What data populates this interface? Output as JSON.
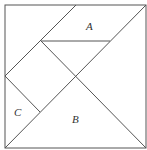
{
  "diagram": {
    "labels": {
      "a": "A",
      "b": "B",
      "c": "C"
    }
  }
}
